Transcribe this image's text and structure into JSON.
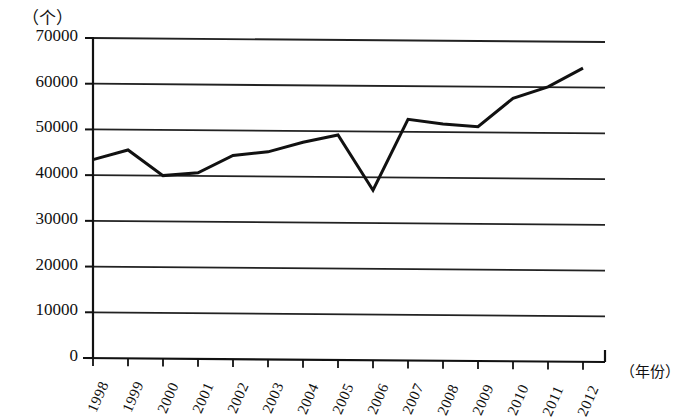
{
  "chart_data": {
    "type": "line",
    "title": "",
    "subtitle": "",
    "xlabel": "（年份）",
    "ylabel": "（个）",
    "unit_note": "（个）",
    "categories": [
      "1998",
      "1999",
      "2000",
      "2001",
      "2002",
      "2003",
      "2004",
      "2005",
      "2006",
      "2007",
      "2008",
      "2009",
      "2010",
      "2011",
      "2012"
    ],
    "values": [
      43400,
      45500,
      39900,
      40500,
      44300,
      45100,
      47200,
      48800,
      36700,
      52200,
      51200,
      50600,
      56800,
      59300,
      63400
    ],
    "series": [
      {
        "name": "数量",
        "values": [
          43400,
          45500,
          39900,
          40500,
          44300,
          45100,
          47200,
          48800,
          36700,
          52200,
          51200,
          50600,
          56800,
          59300,
          63400
        ]
      }
    ],
    "ylim": [
      0,
      70000
    ],
    "yticks": [
      0,
      10000,
      20000,
      30000,
      40000,
      50000,
      60000,
      70000
    ],
    "ytick_labels": [
      "0",
      "10000",
      "20000",
      "30000",
      "40000",
      "50000",
      "60000",
      "70000"
    ],
    "xtick_labels": [
      "1998",
      "1999",
      "2000",
      "2001",
      "2002",
      "2003",
      "2004",
      "2005",
      "2006",
      "2007",
      "2008",
      "2009",
      "2010",
      "2011",
      "2012"
    ],
    "grid": true,
    "grid_axis": "y",
    "legend": false,
    "legend_position": "none",
    "line_color": "#111111",
    "grid_color": "#222222",
    "background_color": "#ffffff"
  },
  "axis": {
    "y_unit_label": "（个）",
    "x_axis_title": "（年份）"
  }
}
